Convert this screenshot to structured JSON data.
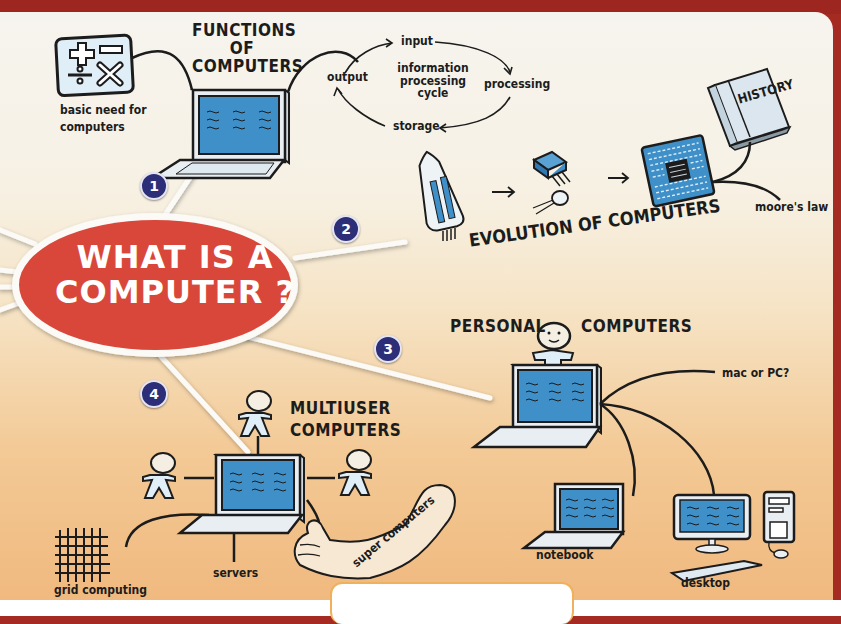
{
  "center": {
    "line1": "WHAT IS A",
    "line2": "COMPUTER ?"
  },
  "colors": {
    "center_fill": "#d9473b",
    "badge": "#2c2e78",
    "screen": "#3f8fc8",
    "frame": "#a52a22"
  },
  "branches": [
    {
      "number": "1",
      "title": [
        "FUNCTIONS",
        "OF",
        "COMPUTERS"
      ],
      "children": [
        {
          "label": "basic need for computers",
          "lines": [
            "basic need for",
            "computers"
          ],
          "icon": "math-operators-icon"
        },
        {
          "label": "information processing cycle",
          "lines": [
            "information",
            "processing",
            "cycle"
          ],
          "cycle": [
            "input",
            "processing",
            "storage",
            "output"
          ]
        }
      ]
    },
    {
      "number": "2",
      "title": [
        "EVOLUTION OF COMPUTERS"
      ],
      "stages": [
        "vacuum-tube-icon",
        "transistor-icon",
        "microprocessor-icon"
      ],
      "children": [
        {
          "label": "moore's law",
          "book": "HISTORY"
        }
      ]
    },
    {
      "number": "3",
      "title": [
        "PERSONAL",
        "COMPUTERS"
      ],
      "children": [
        {
          "label": "mac or PC?"
        },
        {
          "label": "notebook"
        },
        {
          "label": "desktop"
        }
      ]
    },
    {
      "number": "4",
      "title": [
        "MULTIUSER",
        "COMPUTERS"
      ],
      "children": [
        {
          "label": "grid computing"
        },
        {
          "label": "servers"
        },
        {
          "label": "super computers"
        }
      ]
    }
  ]
}
